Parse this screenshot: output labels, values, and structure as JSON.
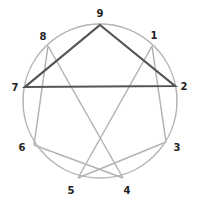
{
  "diagram": {
    "type": "enneagram",
    "colors": {
      "circle": "#b3b3b3",
      "hexad_lines": "#b3b3b3",
      "triangle_lines": "#555555",
      "labels": "#222222"
    },
    "circle": {
      "cx": 100,
      "cy": 101,
      "r": 77
    },
    "points": [
      {
        "label": "9",
        "x": 100,
        "y": 25,
        "lx": 100,
        "ly": 17
      },
      {
        "label": "1",
        "x": 152,
        "y": 46,
        "lx": 154,
        "ly": 39
      },
      {
        "label": "2",
        "x": 175,
        "y": 86,
        "lx": 184,
        "ly": 90
      },
      {
        "label": "3",
        "x": 166,
        "y": 142,
        "lx": 177,
        "ly": 151
      },
      {
        "label": "4",
        "x": 123,
        "y": 178,
        "lx": 127,
        "ly": 194
      },
      {
        "label": "5",
        "x": 78,
        "y": 178,
        "lx": 71,
        "ly": 194
      },
      {
        "label": "6",
        "x": 34,
        "y": 145,
        "lx": 22,
        "ly": 151
      },
      {
        "label": "7",
        "x": 25,
        "y": 87,
        "lx": 15,
        "ly": 91
      },
      {
        "label": "8",
        "x": 48,
        "y": 46,
        "lx": 43,
        "ly": 40
      }
    ],
    "triangle": [
      "9",
      "2",
      "7"
    ],
    "hexad": [
      "1",
      "4",
      "2",
      "8",
      "5",
      "7"
    ],
    "hexad_actual": [
      "1",
      "5",
      "6",
      "8",
      "4",
      "3"
    ]
  }
}
